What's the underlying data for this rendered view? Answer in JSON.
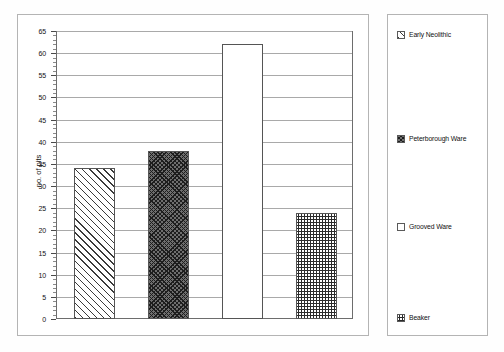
{
  "chart_data": {
    "type": "bar",
    "title": "",
    "subtitle": "",
    "xlabel": "",
    "ylabel": "no. of pits",
    "categories": [
      "Early Neolithic",
      "Peterborough Ware",
      "Grooved Ware",
      "Beaker"
    ],
    "values": [
      34,
      38,
      62,
      24
    ],
    "series": [
      {
        "name": "no. of pits",
        "values": [
          34,
          38,
          62,
          24
        ]
      }
    ],
    "ylim": [
      0,
      65
    ],
    "ytick_step": 5,
    "yticks": [
      0,
      5,
      10,
      15,
      20,
      25,
      30,
      35,
      40,
      45,
      50,
      55,
      60,
      65
    ],
    "ytick_labels": [
      "0",
      "5",
      "10",
      "15",
      "20",
      "25",
      "30",
      "35",
      "40",
      "45",
      "50",
      "55",
      "60",
      "65"
    ],
    "xticks": [],
    "xtick_labels": [],
    "grid": "horizontal",
    "legend_position": "right",
    "minor_ticks": true,
    "bar_fills": [
      "diagonal-hatch",
      "dark-crosshatch",
      "white-empty",
      "stipple-checker"
    ],
    "colors": {
      "axis": "#6d6d6d",
      "gridline": "#a9a9a9",
      "bar_outline": "#555555",
      "text": "#111111",
      "frame": "#b4b4b4",
      "background": "#ffffff"
    }
  },
  "legend": {
    "items": [
      {
        "label": "Early Neolithic",
        "pattern": "diagonal-hatch"
      },
      {
        "label": "Peterborough Ware",
        "pattern": "dark-crosshatch"
      },
      {
        "label": "Grooved Ware",
        "pattern": "white-empty"
      },
      {
        "label": "Beaker",
        "pattern": "stipple-checker"
      }
    ]
  },
  "axis": {
    "y_title": "no. of pits"
  }
}
